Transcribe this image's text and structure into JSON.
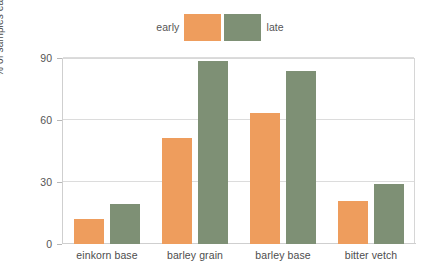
{
  "chart_data": {
    "type": "bar",
    "title": "",
    "subtitle": "",
    "xlabel": "",
    "ylabel": "% of samples each is present in",
    "categories": [
      "einkorn base",
      "barley grain",
      "barley base",
      "bitter vetch"
    ],
    "series": [
      {
        "name": "early",
        "color": "#ee9d5d",
        "values": [
          12,
          51.5,
          63.5,
          21
        ]
      },
      {
        "name": "late",
        "color": "#7e9075",
        "values": [
          19.5,
          88.5,
          83.5,
          29
        ]
      }
    ],
    "ylim": [
      0,
      90
    ],
    "yticks": [
      0,
      30,
      60,
      90
    ],
    "ytick_labels": [
      "0",
      "30",
      "60",
      "90"
    ],
    "grid": true,
    "grid_axis": "y",
    "legend_position": "top-center",
    "bar_group_mode": "grouped"
  },
  "legend": {
    "entries": [
      {
        "label": "early",
        "color": "#ee9d5d"
      },
      {
        "label": "late",
        "color": "#7e9075"
      }
    ]
  },
  "axes": {
    "y_title": "% of samples each is present in",
    "y_tick_0": "0",
    "y_tick_1": "30",
    "y_tick_2": "60",
    "y_tick_3": "90",
    "x_cat_0": "einkorn base",
    "x_cat_1": "barley grain",
    "x_cat_2": "barley base",
    "x_cat_3": "bitter vetch"
  },
  "colors": {
    "early": "#ee9d5d",
    "late": "#7e9075",
    "grid": "#dcdcdc",
    "axis": "#cfcfcf",
    "text": "#4d4d4d"
  }
}
